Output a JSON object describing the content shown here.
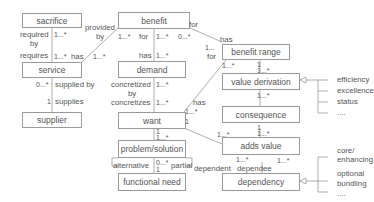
{
  "classes": {
    "sacrifice": "sacrifice",
    "benefit": "benefit",
    "service": "service",
    "demand": "demand",
    "benefit_range": "benefit range",
    "value_derivation": "value derivation",
    "supplier": "supplier",
    "want": "want",
    "consequence": "consequence",
    "problem_solution": "problem/solution",
    "adds_value": "adds value",
    "functional_need": "functional need",
    "dependency": "dependency"
  },
  "roles": {
    "required_by": "required",
    "required_by2": "by",
    "requires": "requires",
    "provided_by": "provided",
    "provided_by2": "by",
    "has_service": "has",
    "for_benefit": "for",
    "has_demand": "has",
    "for_range": "for",
    "has_range": "has",
    "for_want": "for",
    "supplied_by": "supplied by",
    "supplies": "supplies",
    "concretized_by": "concretized",
    "concretized_by2": "by",
    "concretizes": "concretizes",
    "has_want": "has",
    "alternative": "alternative",
    "partial": "partial",
    "dependent": "dependent",
    "dependee": "dependee"
  },
  "multiplicities": {
    "sac_top": "1...*",
    "sac_bot": "1...*",
    "ben_left": "1...*",
    "ben_mid": "1...*",
    "ben_right": "0...*",
    "serv_has": "1...*",
    "dem_has": "1...*",
    "range_1": "1...",
    "range_star": "*",
    "range_bl": "1...*",
    "range_to_vd_1": "1",
    "range_to_vd_2": "1...*",
    "vd_to_cons": "1...*",
    "cons_top": "1",
    "serv_sup": "0...*",
    "sup_1": "1",
    "dem_conc1": "1...*",
    "dem_conc2": "1...*",
    "want_has1": "1...*",
    "want_has2": "1",
    "want_ps1": "1",
    "want_ps2": "1...*",
    "ps_fn1": "0...*",
    "ps_fn2": "1",
    "av_left": "1...*",
    "cons_av1": "1",
    "cons_av2": "1...*",
    "av_dep1": "1...*",
    "av_dep2": "1...*",
    "av_dep3": "0...*"
  },
  "value_derivation_kinds": [
    "efficiency",
    "excellence",
    "status",
    "...."
  ],
  "dependency_kinds": [
    "core/",
    "enhancing",
    "optional",
    "bundling",
    "...."
  ]
}
